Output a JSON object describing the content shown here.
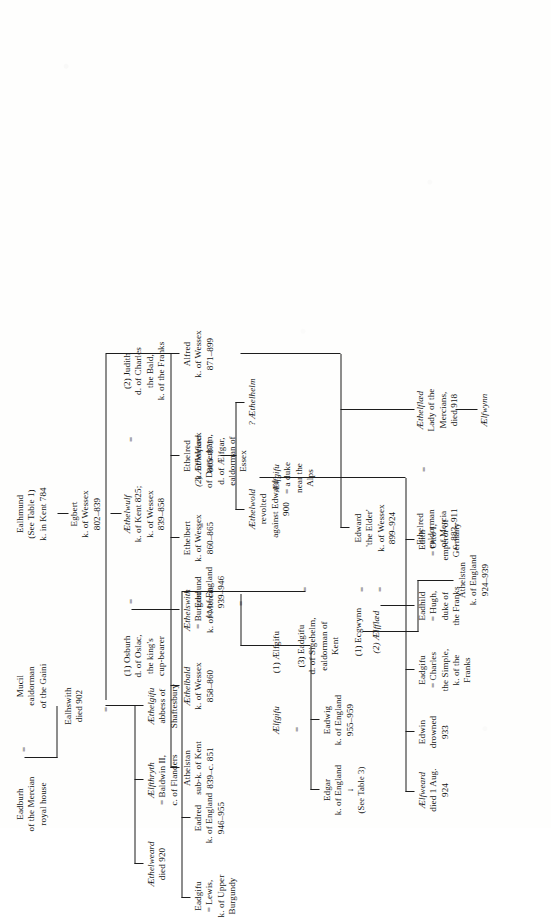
{
  "document": {
    "type": "genealogical-table",
    "title": "The House of Wessex",
    "orientation": "rotated-90-ccw",
    "ink_color": "#1d1d1d",
    "paper_color": "#fefefd"
  },
  "symbols": {
    "marriage": "=",
    "see_table_arrow": "↓"
  },
  "nodes": {
    "ealhmund": {
      "l1": "Ealhmund",
      "l2": "(See Table 1)",
      "l3": "k. in Kent 784"
    },
    "egbert": {
      "l1": "Egbert",
      "l2": "k. of Wessex",
      "l3": "802–839"
    },
    "aethelwulf": {
      "l1": "Æthelwulf",
      "l2": "k. of Kent 825;",
      "l3": "k. of Wessex",
      "l4": "839–858"
    },
    "osburh": {
      "l1": "(1) Osburh",
      "l2": "d. of Oslac,",
      "l3": "the king's",
      "l4": "cup-bearer"
    },
    "judith": {
      "l1": "(2) Judith",
      "l2": "d. of Charles",
      "l3": "the Bald,",
      "l4": "k. of the Franks"
    },
    "athelstan_kent": {
      "l1": "Athelstan",
      "l2": "sub-k. of Kent",
      "l3": "839–c. 851"
    },
    "aethelbald": {
      "l1": "Æthelbald",
      "l2": "k. of Wessex",
      "l3": "858–860"
    },
    "aethelswith": {
      "l1": "Æthelswith",
      "l2": "= Burgred",
      "l3": "k. of Mercia"
    },
    "ethelbert": {
      "l1": "Ethelbert",
      "l2": "k. of Wessex",
      "l3": "860–865"
    },
    "ethelred": {
      "l1": "Ethelred",
      "l2": "k. of Wessex",
      "l3": "865–871"
    },
    "alfred": {
      "l1": "Alfred",
      "l2": "k. of Wessex",
      "l3": "871–899"
    },
    "aethelwold": {
      "l1": "Æthelwold",
      "l2": "revolted",
      "l3": "against Edward",
      "l4": "900"
    },
    "aethelhelm": {
      "l1": "? Æthelhelm"
    },
    "mucil": {
      "l1": "Mucil",
      "l2": "ealdorman",
      "l3": "of the Gaini"
    },
    "eadburh": {
      "l1": "Eadburh",
      "l2": "of the Mercian",
      "l3": "royal house"
    },
    "ealhswith": {
      "l1": "Ealhswith",
      "l2": "died 902"
    },
    "aethelgifu": {
      "l1": "Æthelgifu",
      "l2": "abbess of",
      "l3": "Shaftesbury"
    },
    "aelfthryth": {
      "l1": "Ælfthryth",
      "l2": "= Baldwin II,",
      "l3": "c. of Flanders"
    },
    "aethelweard": {
      "l1": "Æthelweard",
      "l2": "died 920"
    },
    "ethelred_mercia": {
      "l1": "Ethelred",
      "l2": "ealdorman",
      "l3": "of Mercia",
      "l4": "c. 883–911"
    },
    "aethelflaed": {
      "l1": "Æthelflæd",
      "l2": "Lady of the",
      "l3": "Mercians,",
      "l4": "died 918"
    },
    "aelfwynn": {
      "l1": "Ælfwynn"
    },
    "edward_elder": {
      "l1": "Edward",
      "l2": "'the Elder'",
      "l3": "k. of Wessex",
      "l4": "899–924"
    },
    "ecgwynn": {
      "l1": "(1) Ecgwynn"
    },
    "aelfflaed": {
      "l1": "(2) Ælfflæd"
    },
    "eadgifu_sigehelm": {
      "l1": "(3) Eadgifu",
      "l2": "d. of Sigehelm,",
      "l3": "ealdorman of",
      "l4": "Kent"
    },
    "athelstan_england": {
      "l1": "Athelstan",
      "l2": "k. of England",
      "l3": "924–939"
    },
    "aelfweard": {
      "l1": "Ælfweard",
      "l2": "died 1 Aug.",
      "l3": "924"
    },
    "edwin": {
      "l1": "Edwin",
      "l2": "drowned",
      "l3": "933"
    },
    "eadgifu_charles": {
      "l1": "Eadgifu",
      "l2": "= Charles",
      "l3": "the Simple,",
      "l4": "k. of the",
      "l5": "Franks"
    },
    "eadhild": {
      "l1": "Eadhild",
      "l2": "= Hugh,",
      "l3": "duke of",
      "l4": "the Franks"
    },
    "edith": {
      "l1": "Edith",
      "l2": "= Otto I,",
      "l3": "emperor of",
      "l4": "Germany"
    },
    "aelfgifu_duke": {
      "l1": "Ælfgifu",
      "l2": "= a duke",
      "l3": "near the",
      "l4": "Alps"
    },
    "aelfgifu_first": {
      "l1": "(1) Ælfgifu"
    },
    "edmund": {
      "l1": "Edmund",
      "l2": "k. of England",
      "l3": "939–946"
    },
    "aethelflaed_damerham": {
      "l1": "(2) Æthelflæd",
      "l2": "of Damerham,",
      "l3": "d. of Ælfgar,",
      "l4": "ealdorman of",
      "l5": "Essex"
    },
    "eadred": {
      "l1": "Eadred",
      "l2": "k. of England",
      "l3": "946–955"
    },
    "eadgifu_lewis": {
      "l1": "Eadgifu",
      "l2": "= Lewis,",
      "l3": "k. of Upper",
      "l4": "Burgundy"
    },
    "eadwig": {
      "l1": "Eadwig",
      "l2": "k. of England",
      "l3": "955–959"
    },
    "aelfgifu_eadwig": {
      "l1": "Ælfgifu"
    },
    "edgar": {
      "l1": "Edgar",
      "l2": "k. of England",
      "l3": "↓",
      "l4": "(See Table 3)"
    }
  }
}
